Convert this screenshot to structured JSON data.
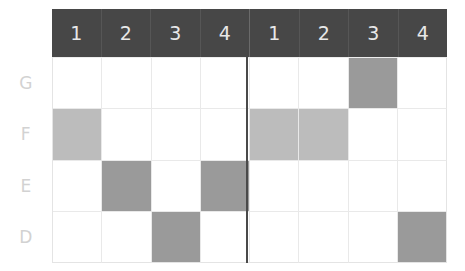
{
  "chart_data": {
    "type": "heatmap",
    "title": "",
    "xlabel": "",
    "ylabel": "",
    "grid": true,
    "legend": "none",
    "column_headers": [
      "1",
      "2",
      "3",
      "4",
      "1",
      "2",
      "3",
      "4"
    ],
    "column_blocks": [
      {
        "headers": [
          "1",
          "2",
          "3",
          "4"
        ]
      },
      {
        "headers": [
          "1",
          "2",
          "3",
          "4"
        ]
      }
    ],
    "row_labels": [
      "G",
      "F",
      "E",
      "D"
    ],
    "fill_levels": {
      "empty": "#ffffff",
      "light": "#bcbcbc",
      "medium": "#9a9a9a"
    },
    "values": [
      [
        "empty",
        "empty",
        "empty",
        "empty",
        "empty",
        "empty",
        "medium",
        "empty"
      ],
      [
        "light",
        "empty",
        "empty",
        "empty",
        "light",
        "light",
        "empty",
        "empty"
      ],
      [
        "empty",
        "medium",
        "empty",
        "medium",
        "empty",
        "empty",
        "empty",
        "empty"
      ],
      [
        "empty",
        "empty",
        "medium",
        "empty",
        "empty",
        "empty",
        "empty",
        "medium"
      ]
    ],
    "filled_cells": [
      {
        "row": "G",
        "block": 2,
        "column": "3",
        "level": "medium"
      },
      {
        "row": "F",
        "block": 1,
        "column": "1",
        "level": "light"
      },
      {
        "row": "F",
        "block": 2,
        "column": "1",
        "level": "light"
      },
      {
        "row": "F",
        "block": 2,
        "column": "2",
        "level": "light"
      },
      {
        "row": "E",
        "block": 1,
        "column": "2",
        "level": "medium"
      },
      {
        "row": "E",
        "block": 1,
        "column": "4",
        "level": "medium"
      },
      {
        "row": "D",
        "block": 1,
        "column": "3",
        "level": "medium"
      },
      {
        "row": "D",
        "block": 2,
        "column": "4",
        "level": "medium"
      }
    ]
  },
  "colors": {
    "header_background": "#474747",
    "header_text": "#e8e8e8",
    "row_label_text": "#d2d2d2",
    "grid_line": "#e9e9e9",
    "divider": "#4a4a4a",
    "cell_light": "#bcbcbc",
    "cell_medium": "#9a9a9a",
    "background": "#ffffff"
  }
}
